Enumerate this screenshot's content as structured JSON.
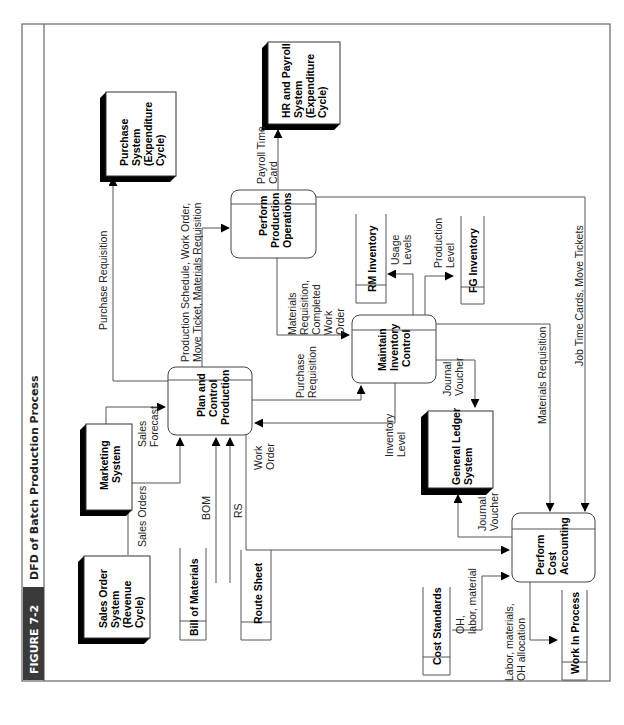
{
  "figure": {
    "number": "FIGURE 7-2",
    "title": "DFD of Batch Production Process",
    "colors": {
      "caption_bg": "#3a3a3a",
      "caption_fg": "#ffffff",
      "title_fg": "#222222"
    }
  },
  "external_entities": {
    "sales_order": [
      "Sales Order",
      "System",
      "(Revenue",
      "Cycle)"
    ],
    "marketing": [
      "Marketing",
      "System"
    ],
    "purchase": [
      "Purchase",
      "System",
      "(Expenditure",
      "Cycle)"
    ],
    "hr_payroll": [
      "HR and Payroll",
      "System",
      "(Expenditure",
      "Cycle)"
    ],
    "general_ledger": [
      "General Ledger",
      "System"
    ]
  },
  "processes": {
    "plan_control": [
      "Plan and",
      "Control",
      "Production"
    ],
    "perform_production": [
      "Perform",
      "Production",
      "Operations"
    ],
    "maintain_inventory": [
      "Maintain",
      "Inventory",
      "Control"
    ],
    "cost_accounting": [
      "Perform",
      "Cost",
      "Accounting"
    ]
  },
  "data_stores": {
    "bom": "Bill of Materials",
    "route_sheet": "Route Sheet",
    "rm_inventory": "RM Inventory",
    "fg_inventory": "FG Inventory",
    "cost_standards": "Cost Standards",
    "wip": "Work In Process"
  },
  "flows": {
    "sales_orders": "Sales Orders",
    "sales_forecast": [
      "Sales",
      "Forecast"
    ],
    "bom": "BOM",
    "rs": "RS",
    "work_order": [
      "Work",
      "Order"
    ],
    "purchase_requisition_top": "Purchase Requisition",
    "production_schedule": [
      "Production Schedule, Work Order,",
      "Move Ticket, Materials Requisition"
    ],
    "payroll_time_card": [
      "Payroll Time",
      "Card"
    ],
    "materials_req_completed": [
      "Materials",
      "Requisition,",
      "Completed",
      "Work",
      "Order"
    ],
    "purchase_requisition_mid": [
      "Purchase",
      "Requisition"
    ],
    "inventory_level": [
      "Inventory",
      "Level"
    ],
    "usage_levels": [
      "Usage",
      "Levels"
    ],
    "production_level": [
      "Production",
      "Level"
    ],
    "journal_voucher_1": [
      "Journal",
      "Voucher"
    ],
    "journal_voucher_2": [
      "Journal",
      "Voucher"
    ],
    "materials_requisition": "Materials Requisition",
    "job_time_cards": "Job Time Cards, Move Tickets",
    "oh_labor_material": [
      "OH,",
      "labor, material"
    ],
    "labor_materials_oh": [
      "Labor, materials,",
      "OH allocation"
    ]
  }
}
